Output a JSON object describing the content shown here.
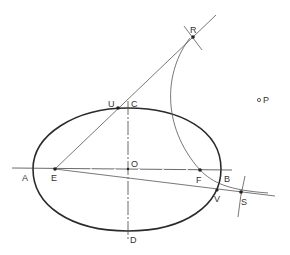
{
  "diagram": {
    "type": "geometric-construction",
    "stroke_color": "#2b2b2b",
    "thin_stroke_color": "#555555",
    "points": {
      "A": {
        "label": "A",
        "x": 33,
        "y": 169
      },
      "B": {
        "label": "B",
        "x": 221,
        "y": 169
      },
      "C": {
        "label": "C",
        "x": 128,
        "y": 108
      },
      "D": {
        "label": "D",
        "x": 128,
        "y": 231
      },
      "O": {
        "label": "O",
        "x": 128,
        "y": 169
      },
      "E": {
        "label": "E",
        "x": 55,
        "y": 169
      },
      "F": {
        "label": "F",
        "x": 200,
        "y": 170
      },
      "R": {
        "label": "R",
        "x": 193,
        "y": 37
      },
      "U": {
        "label": "U",
        "x": 118,
        "y": 108
      },
      "V": {
        "label": "V",
        "x": 217,
        "y": 190
      },
      "S": {
        "label": "S",
        "x": 241,
        "y": 192
      },
      "P": {
        "label": "P",
        "x": 259,
        "y": 100
      }
    }
  }
}
